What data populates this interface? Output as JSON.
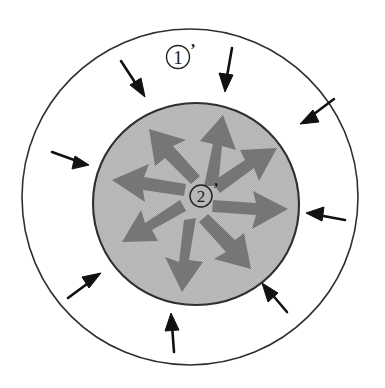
{
  "figure": {
    "background_color": "#ffffff",
    "canvas": {
      "width": 385,
      "height": 388
    }
  },
  "outer_region": {
    "name": "outer-ring-region",
    "label": "①",
    "prime": "’",
    "label_full": "①’",
    "label_position": {
      "x": 183,
      "y": 62
    },
    "fill_color": "#ffffff",
    "stroke_color": "#2b2b2b",
    "center": {
      "x": 190,
      "y": 197
    },
    "radius": 168
  },
  "inner_region": {
    "name": "inner-core-region",
    "label": "②",
    "prime": "’",
    "label_full": "②’",
    "label_position": {
      "x": 203,
      "y": 198
    },
    "fill_color": "#b9b9b9",
    "stroke_color": "#2b2b2b",
    "center": {
      "x": 196,
      "y": 204
    },
    "radius_x": 103,
    "radius_y": 101
  },
  "external_arrows": {
    "name": "inward-black-arrows",
    "color": "#111111",
    "direction": "inward",
    "count": 8,
    "items": [
      {
        "id": "arrow-in-top",
        "angle_deg": 90,
        "label": "top, pointing down"
      },
      {
        "id": "arrow-in-top-left",
        "angle_deg": 125,
        "label": "upper-left, pointing down-right"
      },
      {
        "id": "arrow-in-top-right",
        "angle_deg": 48,
        "label": "upper-right, pointing down-left"
      },
      {
        "id": "arrow-in-left",
        "angle_deg": 172,
        "label": "left, pointing right"
      },
      {
        "id": "arrow-in-right",
        "angle_deg": 8,
        "label": "right, pointing left"
      },
      {
        "id": "arrow-in-bottom-left",
        "angle_deg": 218,
        "label": "lower-left, pointing up-right"
      },
      {
        "id": "arrow-in-bottom-right",
        "angle_deg": 315,
        "label": "lower-right, pointing up-left"
      },
      {
        "id": "arrow-in-bottom",
        "angle_deg": 268,
        "label": "bottom, pointing up"
      }
    ]
  },
  "internal_arrows": {
    "name": "outward-gray-arrows",
    "color": "#767676",
    "direction": "outward",
    "count": 8,
    "items": [
      {
        "id": "arrow-out-n",
        "angle_deg": 80,
        "label": "pointing up"
      },
      {
        "id": "arrow-out-ne",
        "angle_deg": 40,
        "label": "pointing up-right"
      },
      {
        "id": "arrow-out-e",
        "angle_deg": 5,
        "label": "pointing right"
      },
      {
        "id": "arrow-out-se",
        "angle_deg": 318,
        "label": "pointing down-right"
      },
      {
        "id": "arrow-out-s",
        "angle_deg": 268,
        "label": "pointing down"
      },
      {
        "id": "arrow-out-sw",
        "angle_deg": 222,
        "label": "pointing down-left"
      },
      {
        "id": "arrow-out-w",
        "angle_deg": 172,
        "label": "pointing left"
      },
      {
        "id": "arrow-out-nw",
        "angle_deg": 125,
        "label": "pointing up-left"
      }
    ]
  }
}
